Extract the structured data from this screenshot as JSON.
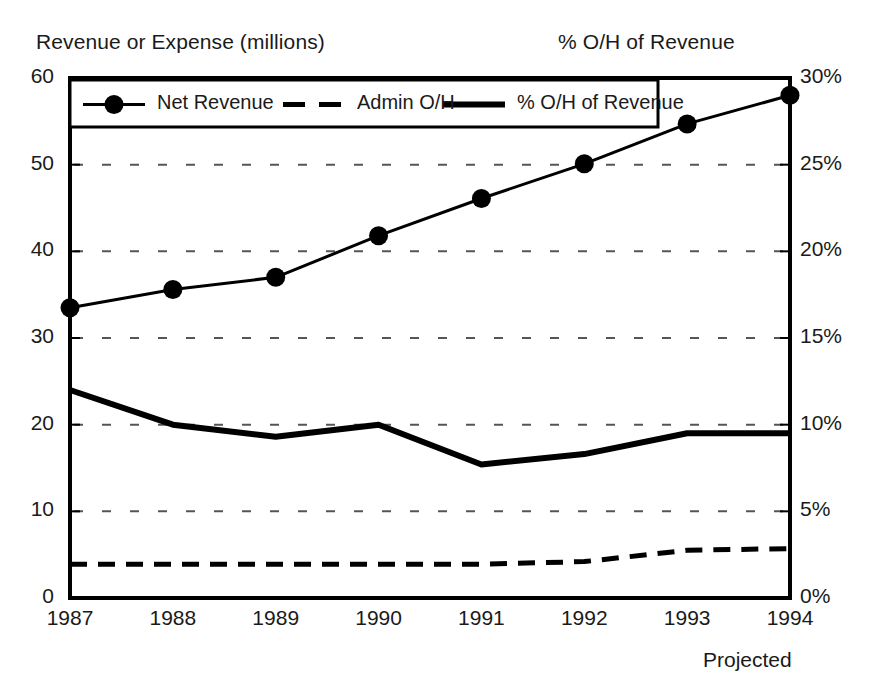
{
  "header": {
    "left_axis_title": "Revenue or Expense (millions)",
    "right_axis_title": "% O/H of Revenue"
  },
  "footnote": "Projected",
  "legend": {
    "items": [
      {
        "label": "Net Revenue",
        "style": "solid-with-marker",
        "color": "#000000"
      },
      {
        "label": "Admin O/H",
        "style": "dashed",
        "color": "#000000"
      },
      {
        "label": "% O/H of Revenue",
        "style": "solid-thick",
        "color": "#000000"
      }
    ]
  },
  "chart_data": {
    "type": "line",
    "title": "",
    "xlabel": "",
    "ylabel": "Revenue or Expense (millions)",
    "y2label": "% O/H of Revenue",
    "grid": true,
    "legend_position": "top-inside",
    "x": [
      "1987",
      "1988",
      "1989",
      "1990",
      "1991",
      "1992",
      "1993",
      "1994"
    ],
    "xtick_labels": [
      "1987",
      "1988",
      "1989",
      "1990",
      "1991",
      "1992",
      "1993",
      "1994"
    ],
    "ylim": [
      0,
      60
    ],
    "ytick_labels": [
      "0",
      "10",
      "20",
      "30",
      "40",
      "50",
      "60"
    ],
    "ytick_values": [
      0,
      10,
      20,
      30,
      40,
      50,
      60
    ],
    "y2lim": [
      0,
      30
    ],
    "y2tick_labels": [
      "0%",
      "5%",
      "10%",
      "15%",
      "20%",
      "25%",
      "30%"
    ],
    "y2tick_values": [
      0,
      5,
      10,
      15,
      20,
      25,
      30
    ],
    "series": [
      {
        "name": "Net Revenue",
        "axis": "left",
        "style": "solid-with-marker",
        "values": [
          33.5,
          35.6,
          37.0,
          41.8,
          46.1,
          50.1,
          54.7,
          58.0
        ]
      },
      {
        "name": "Admin O/H",
        "axis": "left",
        "style": "dashed",
        "values": [
          3.9,
          3.9,
          3.9,
          3.9,
          3.9,
          4.2,
          5.5,
          5.7
        ]
      },
      {
        "name": "% O/H of Revenue",
        "axis": "right",
        "style": "solid-thick",
        "values": [
          12.0,
          10.0,
          9.3,
          10.0,
          7.7,
          8.3,
          9.5,
          9.5
        ]
      }
    ],
    "annotations": [
      {
        "text": "Projected",
        "near": "1994"
      }
    ]
  },
  "colors": {
    "ink": "#000000",
    "text": "#1a1a1a",
    "grid": "#555555",
    "background": "#ffffff"
  }
}
